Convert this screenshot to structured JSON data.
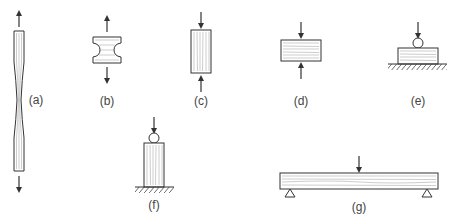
{
  "figure": {
    "colors": {
      "line": "#333333",
      "grain": "#9a9a9a",
      "label": "#444444",
      "background": "#ffffff"
    },
    "panels": [
      {
        "id": "a",
        "label": "(a)",
        "description": "Tension parallel to grain (dog-bone specimen)",
        "load": "tension",
        "grain": "vertical"
      },
      {
        "id": "b",
        "label": "(b)",
        "description": "Tension perpendicular to grain",
        "load": "tension",
        "grain": "horizontal"
      },
      {
        "id": "c",
        "label": "(c)",
        "description": "Compression parallel to grain",
        "load": "compression",
        "grain": "vertical"
      },
      {
        "id": "d",
        "label": "(d)",
        "description": "Compression perpendicular to grain",
        "load": "compression",
        "grain": "horizontal"
      },
      {
        "id": "e",
        "label": "(e)",
        "description": "Bearing perpendicular to grain on support",
        "load": "point-load-on-support",
        "grain": "horizontal"
      },
      {
        "id": "f",
        "label": "(f)",
        "description": "Bearing parallel to grain on support",
        "load": "point-load-on-support",
        "grain": "vertical"
      },
      {
        "id": "g",
        "label": "(g)",
        "description": "Simply supported beam in bending",
        "load": "midspan-point-load",
        "grain": "horizontal"
      }
    ]
  }
}
